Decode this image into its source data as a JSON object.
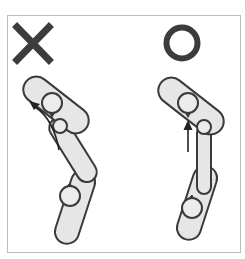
{
  "diagram": {
    "type": "comparison",
    "panels": [
      {
        "id": "incorrect",
        "symbol": "cross",
        "symbol_label": "X",
        "meaning": "incorrect",
        "arrow": "curved",
        "arrow_direction": "up-left"
      },
      {
        "id": "correct",
        "symbol": "circle",
        "symbol_label": "O",
        "meaning": "correct",
        "arrow": "straight",
        "arrow_direction": "up"
      }
    ]
  },
  "colors": {
    "symbol": "#3c3c3c",
    "limb_fill": "#e6e6e6",
    "outline": "#3a3a3a",
    "frame": "#bdbdbd",
    "background": "#ffffff"
  }
}
